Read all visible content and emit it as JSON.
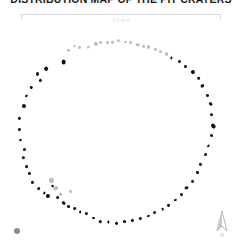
{
  "figure": {
    "title": "DISTRIBUTION MAP OF THE PIT CRATERS",
    "background_color": "#ffffff"
  },
  "scalebar": {
    "label": "10 km",
    "line_color": "#d9d9dd",
    "length_px": 200
  },
  "legend": {
    "marker_color": "#8c8c8c",
    "label": ""
  },
  "north_arrow": {
    "icon": "north-arrow-icon",
    "label": "N",
    "color": "#b6b6bb"
  },
  "chart_data": {
    "type": "scatter",
    "title": "DISTRIBUTION MAP OF THE PIT CRATERS",
    "xlabel": "",
    "ylabel": "",
    "xlim": [
      0,
      242
    ],
    "ylim": [
      0,
      246
    ],
    "grid": false,
    "legend_position": "bottom-left",
    "series": [
      {
        "name": "pit craters (dark)",
        "color": "#111111",
        "points": [
          {
            "x": 64,
            "y": 62,
            "r": 2.6
          },
          {
            "x": 46,
            "y": 69,
            "r": 1.8
          },
          {
            "x": 38,
            "y": 74,
            "r": 1.6
          },
          {
            "x": 40,
            "y": 80,
            "r": 1.5
          },
          {
            "x": 31,
            "y": 88,
            "r": 1.4
          },
          {
            "x": 26,
            "y": 96,
            "r": 1.3
          },
          {
            "x": 24,
            "y": 106,
            "r": 1.8
          },
          {
            "x": 20,
            "y": 118,
            "r": 1.6
          },
          {
            "x": 19,
            "y": 130,
            "r": 1.5
          },
          {
            "x": 21,
            "y": 140,
            "r": 1.6
          },
          {
            "x": 24,
            "y": 149,
            "r": 1.5
          },
          {
            "x": 23,
            "y": 158,
            "r": 1.3
          },
          {
            "x": 27,
            "y": 166,
            "r": 1.6
          },
          {
            "x": 29,
            "y": 174,
            "r": 1.4
          },
          {
            "x": 33,
            "y": 182,
            "r": 1.6
          },
          {
            "x": 38,
            "y": 189,
            "r": 1.5
          },
          {
            "x": 44,
            "y": 193,
            "r": 1.4
          },
          {
            "x": 48,
            "y": 196,
            "r": 2.0
          },
          {
            "x": 52,
            "y": 186,
            "r": 1.5
          },
          {
            "x": 58,
            "y": 198,
            "r": 1.6
          },
          {
            "x": 63,
            "y": 203,
            "r": 1.5
          },
          {
            "x": 68,
            "y": 206,
            "r": 1.4
          },
          {
            "x": 74,
            "y": 209,
            "r": 1.5
          },
          {
            "x": 80,
            "y": 212,
            "r": 1.3
          },
          {
            "x": 86,
            "y": 214,
            "r": 1.5
          },
          {
            "x": 93,
            "y": 218,
            "r": 1.4
          },
          {
            "x": 100,
            "y": 221,
            "r": 1.3
          },
          {
            "x": 108,
            "y": 222,
            "r": 1.5
          },
          {
            "x": 116,
            "y": 223,
            "r": 1.4
          },
          {
            "x": 124,
            "y": 222,
            "r": 1.3
          },
          {
            "x": 132,
            "y": 220,
            "r": 1.5
          },
          {
            "x": 140,
            "y": 219,
            "r": 1.4
          },
          {
            "x": 148,
            "y": 216,
            "r": 1.3
          },
          {
            "x": 155,
            "y": 213,
            "r": 1.6
          },
          {
            "x": 162,
            "y": 209,
            "r": 1.5
          },
          {
            "x": 168,
            "y": 205,
            "r": 1.4
          },
          {
            "x": 175,
            "y": 200,
            "r": 1.5
          },
          {
            "x": 181,
            "y": 194,
            "r": 1.4
          },
          {
            "x": 187,
            "y": 188,
            "r": 1.6
          },
          {
            "x": 192,
            "y": 181,
            "r": 1.5
          },
          {
            "x": 197,
            "y": 173,
            "r": 1.4
          },
          {
            "x": 201,
            "y": 164,
            "r": 1.6
          },
          {
            "x": 205,
            "y": 155,
            "r": 1.5
          },
          {
            "x": 208,
            "y": 146,
            "r": 1.4
          },
          {
            "x": 211,
            "y": 136,
            "r": 1.5
          },
          {
            "x": 213,
            "y": 126,
            "r": 2.4
          },
          {
            "x": 212,
            "y": 115,
            "r": 1.6
          },
          {
            "x": 210,
            "y": 104,
            "r": 1.5
          },
          {
            "x": 207,
            "y": 95,
            "r": 1.4
          },
          {
            "x": 203,
            "y": 86,
            "r": 1.6
          },
          {
            "x": 198,
            "y": 78,
            "r": 1.5
          },
          {
            "x": 193,
            "y": 72,
            "r": 2.0
          },
          {
            "x": 186,
            "y": 66,
            "r": 1.6
          },
          {
            "x": 179,
            "y": 62,
            "r": 1.5
          },
          {
            "x": 171,
            "y": 58,
            "r": 1.4
          }
        ]
      },
      {
        "name": "pit craters (light)",
        "color": "#bcbcc2",
        "points": [
          {
            "x": 96,
            "y": 44,
            "r": 1.8
          },
          {
            "x": 101,
            "y": 42,
            "r": 1.6
          },
          {
            "x": 107,
            "y": 43,
            "r": 1.5
          },
          {
            "x": 113,
            "y": 42,
            "r": 1.7
          },
          {
            "x": 119,
            "y": 41,
            "r": 1.6
          },
          {
            "x": 125,
            "y": 42,
            "r": 1.5
          },
          {
            "x": 131,
            "y": 43,
            "r": 1.6
          },
          {
            "x": 137,
            "y": 45,
            "r": 1.5
          },
          {
            "x": 143,
            "y": 46,
            "r": 1.4
          },
          {
            "x": 149,
            "y": 47,
            "r": 1.6
          },
          {
            "x": 155,
            "y": 49,
            "r": 1.5
          },
          {
            "x": 160,
            "y": 52,
            "r": 1.4
          },
          {
            "x": 88,
            "y": 47,
            "r": 1.5
          },
          {
            "x": 80,
            "y": 48,
            "r": 1.6
          },
          {
            "x": 74,
            "y": 46,
            "r": 1.5
          },
          {
            "x": 68,
            "y": 50,
            "r": 1.4
          },
          {
            "x": 166,
            "y": 54,
            "r": 1.5
          },
          {
            "x": 52,
            "y": 180,
            "r": 2.6
          },
          {
            "x": 56,
            "y": 188,
            "r": 2.0
          },
          {
            "x": 60,
            "y": 194,
            "r": 1.5
          },
          {
            "x": 70,
            "y": 192,
            "r": 1.4
          }
        ]
      }
    ]
  }
}
